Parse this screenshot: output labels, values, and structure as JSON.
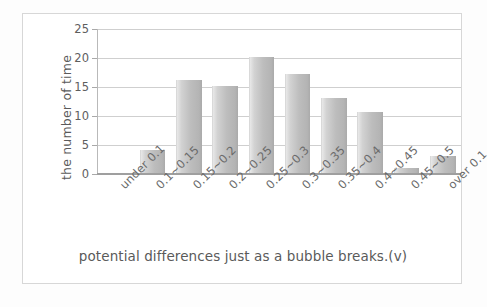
{
  "chart_data": {
    "type": "bar",
    "title": "",
    "xlabel": "potential differences just as a bubble breaks.(v)",
    "ylabel": "the number of time",
    "categories": [
      "under 0.1",
      "0.1~0.15",
      "0.15~0.2",
      "0.2~0.25",
      "0.25~0.3",
      "0.3~0.35",
      "0.35~0.4",
      "0.4~0.45",
      "0.45~0.5",
      "over 0.1"
    ],
    "values": [
      0,
      4,
      16,
      15,
      20,
      17,
      13,
      10.5,
      0.8,
      3
    ],
    "ylim": [
      0,
      25
    ],
    "yticks": [
      0,
      5,
      10,
      15,
      20,
      25
    ],
    "ytick_labels": [
      "0",
      "5",
      "10",
      "15",
      "20",
      "25"
    ],
    "grid": true,
    "legend": false,
    "bar_color": "#bdbdbd",
    "gridline_color": "#cfcfcf",
    "axis_color": "#9f9f9f",
    "text_color": "#5a5a5a",
    "frame_color": "#d7d7d7",
    "background": "#ffffff"
  }
}
